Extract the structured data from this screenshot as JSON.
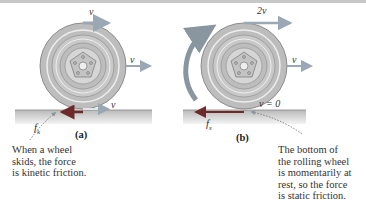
{
  "panel_a": {
    "label": "(a)",
    "v_top": "v",
    "v_center": "v",
    "v_bottom": "v",
    "friction": "f",
    "friction_sub": "k",
    "caption": [
      "When a wheel",
      "skids, the force",
      "is kinetic friction."
    ]
  },
  "panel_b": {
    "label": "(b)",
    "v_top": "2v",
    "v_center": "v",
    "v_bottom": "v = 0",
    "friction": "f",
    "friction_sub": "s",
    "caption": [
      "The bottom of",
      "the rolling wheel",
      "is momentarily at",
      "rest, so the force",
      "is static friction."
    ]
  },
  "colors": {
    "velocity_arrow": "#9aa7b4",
    "friction_arrow": "#6e2a2a",
    "rotation_arrow": "#8a969f",
    "tire": "#b8b8b8",
    "ground": "#c9c9c9"
  }
}
